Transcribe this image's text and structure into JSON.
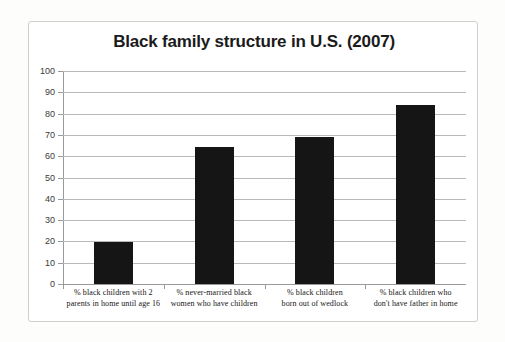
{
  "chart_data": {
    "type": "bar",
    "title": "Black family structure in U.S. (2007)",
    "xlabel": "",
    "ylabel": "",
    "ylim": [
      0,
      100
    ],
    "ytick_step": 10,
    "grid": true,
    "legend": false,
    "categories": [
      "% black children with 2 parents in home until age 16",
      "% never-married black women who have children",
      "% black children born out of wedlock",
      "% black children who don't have father in home"
    ],
    "category_lines": [
      [
        "% black children with 2",
        "parents in home until age 16"
      ],
      [
        "% never-married black",
        "women who have children"
      ],
      [
        "% black children",
        "born out of wedlock"
      ],
      [
        "% black children who",
        "don't have father in home"
      ]
    ],
    "values": [
      19.5,
      64.5,
      69,
      84
    ],
    "yticks": [
      "100",
      "90",
      "80",
      "70",
      "60",
      "50",
      "40",
      "30",
      "20",
      "10",
      "0"
    ],
    "bar_color": "#151515",
    "grid_color": "#b9b9b9",
    "axis_color": "#9a9a9a",
    "title_color": "#1b1b1b"
  }
}
